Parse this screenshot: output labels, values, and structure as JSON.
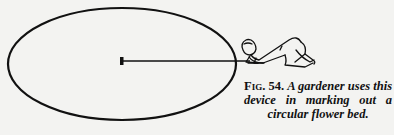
{
  "figure": {
    "label": "Fig. 54.",
    "caption_line1": "A gardener uses this",
    "caption_line2": "device in marking out a",
    "caption_line3": "circular flower bed.",
    "caption_full": "Fig. 54. A gardener uses this device in marking out a circular flower bed.",
    "illustration": {
      "elements": [
        "ellipse-outline-icon",
        "center-peg-icon",
        "cord-line-icon",
        "kneeling-gardener-icon"
      ],
      "ink_color": "#111111",
      "paper_color": "#f3f3f1"
    }
  }
}
